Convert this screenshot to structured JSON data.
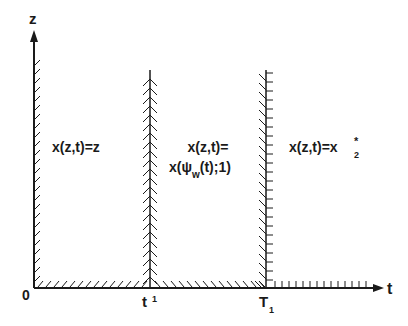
{
  "diagram": {
    "axes": {
      "vertical_label": "z",
      "horizontal_label": "t",
      "origin_label": "0"
    },
    "ticks": [
      {
        "base": "t",
        "sup": "1"
      },
      {
        "base": "T",
        "sub": "1"
      }
    ],
    "regions": [
      {
        "id": "left",
        "line1": "x(z,t)=z"
      },
      {
        "id": "middle",
        "line1": "x(z,t)=",
        "line2_pre": "x(ψ",
        "line2_sub": "w",
        "line2_post": "(t);1)"
      },
      {
        "id": "right",
        "line1": "x(z,t)=x",
        "sub": "2",
        "sup": "*"
      }
    ],
    "colors": {
      "ink": "#1a1a1a",
      "background": "#ffffff"
    }
  }
}
